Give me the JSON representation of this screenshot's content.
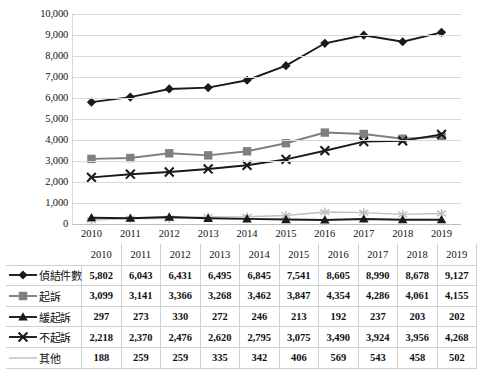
{
  "chart_data": {
    "type": "line",
    "title": "",
    "xlabel": "",
    "ylabel": "",
    "ylim": [
      0,
      10000
    ],
    "ytick_step": 1000,
    "grid": true,
    "legend_position": "table-below",
    "categories": [
      "2010",
      "2011",
      "2012",
      "2013",
      "2014",
      "2015",
      "2016",
      "2017",
      "2018",
      "2019"
    ],
    "series": [
      {
        "name": "偵結件數",
        "marker": "diamond",
        "color": "#1a1a1a",
        "values": [
          5802,
          6043,
          6431,
          6495,
          6845,
          7541,
          8605,
          8990,
          8678,
          9127
        ],
        "labels": [
          "5,802",
          "6,043",
          "6,431",
          "6,495",
          "6,845",
          "7,541",
          "8,605",
          "8,990",
          "8,678",
          "9,127"
        ]
      },
      {
        "name": "起訴",
        "marker": "square",
        "color": "#7f7f7f",
        "values": [
          3099,
          3141,
          3366,
          3268,
          3462,
          3847,
          4354,
          4286,
          4061,
          4155
        ],
        "labels": [
          "3,099",
          "3,141",
          "3,366",
          "3,268",
          "3,462",
          "3,847",
          "4,354",
          "4,286",
          "4,061",
          "4,155"
        ]
      },
      {
        "name": "緩起訴",
        "marker": "triangle",
        "color": "#1a1a1a",
        "values": [
          297,
          273,
          330,
          272,
          246,
          213,
          192,
          237,
          203,
          202
        ],
        "labels": [
          "297",
          "273",
          "330",
          "272",
          "246",
          "213",
          "192",
          "237",
          "203",
          "202"
        ]
      },
      {
        "name": "不起訴",
        "marker": "x",
        "color": "#1a1a1a",
        "values": [
          2218,
          2370,
          2476,
          2620,
          2795,
          3075,
          3490,
          3924,
          3956,
          4268
        ],
        "labels": [
          "2,218",
          "2,370",
          "2,476",
          "2,620",
          "2,795",
          "3,075",
          "3,490",
          "3,924",
          "3,956",
          "4,268"
        ]
      },
      {
        "name": "其他",
        "marker": "asterisk",
        "color": "#bfbfbf",
        "values": [
          188,
          259,
          259,
          335,
          342,
          406,
          569,
          543,
          458,
          502
        ],
        "labels": [
          "188",
          "259",
          "259",
          "335",
          "342",
          "406",
          "569",
          "543",
          "458",
          "502"
        ]
      }
    ],
    "ytick_labels": [
      "10,000",
      "9,000",
      "8,000",
      "7,000",
      "6,000",
      "5,000",
      "4,000",
      "3,000",
      "2,000",
      "1,000",
      "0"
    ]
  }
}
